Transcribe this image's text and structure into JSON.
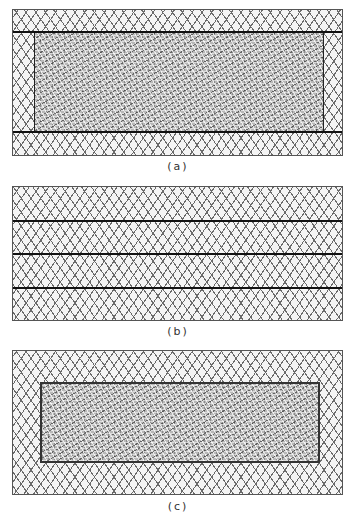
{
  "figure": {
    "panels": [
      {
        "id": "a",
        "caption": "(a)",
        "description": "Textured central layer bounded by two horizontal boundary lines, crosshatched margins on all sides"
      },
      {
        "id": "b",
        "caption": "(b)",
        "description": "Uniform crosshatched region divided by three horizontal lines into four bands"
      },
      {
        "id": "c",
        "caption": "(c)",
        "description": "Textured rectangular inclusion fully enclosed within crosshatched region"
      }
    ],
    "patterns": {
      "crosshatch": "diamond-crosshatch",
      "textured": "dense-speckle-texture"
    },
    "colors": {
      "line": "#111111",
      "border": "#555555",
      "hatch": "#6a6a6a",
      "texture": "#b8b8b8"
    }
  }
}
